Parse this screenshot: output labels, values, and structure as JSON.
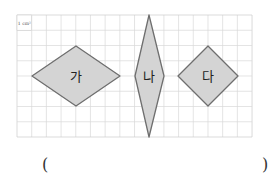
{
  "unit_label": "1 cm²",
  "grid": {
    "cols": 16,
    "rows": 8,
    "x0": 17,
    "y0": 15,
    "cell_w": 14.69,
    "cell_h": 15.25,
    "line_color": "#d9d9d9",
    "border_color": "#cccccc"
  },
  "shapes": [
    {
      "label": "가",
      "points": "32,76 76,46 120,76 76,106",
      "lx": 76,
      "ly": 76
    },
    {
      "label": "나",
      "points": "149,15 164,76 149,137 135,76",
      "lx": 149,
      "ly": 76
    },
    {
      "label": "다",
      "points": "208,46 238,76 208,106 178,76",
      "lx": 208,
      "ly": 76
    }
  ],
  "shape_fill": "#d4d4d4",
  "shape_stroke": "#6e6e6e",
  "answer": {
    "open": "(",
    "close": ")",
    "value": ""
  }
}
